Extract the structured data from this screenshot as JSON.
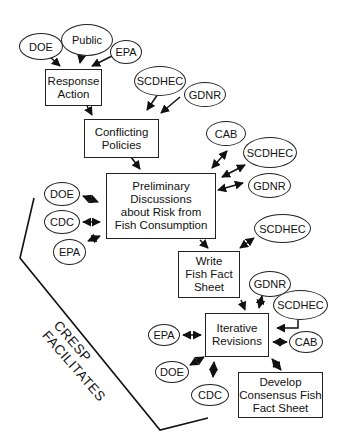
{
  "diagram": {
    "title": "",
    "process_boxes": [
      {
        "id": "response",
        "label": "Response\nAction"
      },
      {
        "id": "conflicting",
        "label": "Conflicting\nPolicies"
      },
      {
        "id": "preliminary",
        "label": "Preliminary\nDiscussions\nabout Risk from\nFish Consumption"
      },
      {
        "id": "write",
        "label": "Write\nFish Fact\nSheet"
      },
      {
        "id": "iterative",
        "label": "Iterative\nRevisions"
      },
      {
        "id": "develop",
        "label": "Develop\nConsensus Fish\nFact Sheet"
      }
    ],
    "stakeholders": {
      "response": [
        "DOE",
        "Public",
        "EPA"
      ],
      "conflicting": [
        "SCDHEC",
        "GDNR"
      ],
      "preliminary_right": [
        "CAB",
        "SCDHEC",
        "GDNR"
      ],
      "preliminary_left": [
        "DOE",
        "CDC",
        "EPA"
      ],
      "write": [
        "SCDHEC"
      ],
      "iterative": [
        "GDNR",
        "SCDHEC",
        "CAB",
        "EPA",
        "DOE",
        "CDC"
      ]
    },
    "facilitator_label": "CRESP\nFACILITATES"
  }
}
